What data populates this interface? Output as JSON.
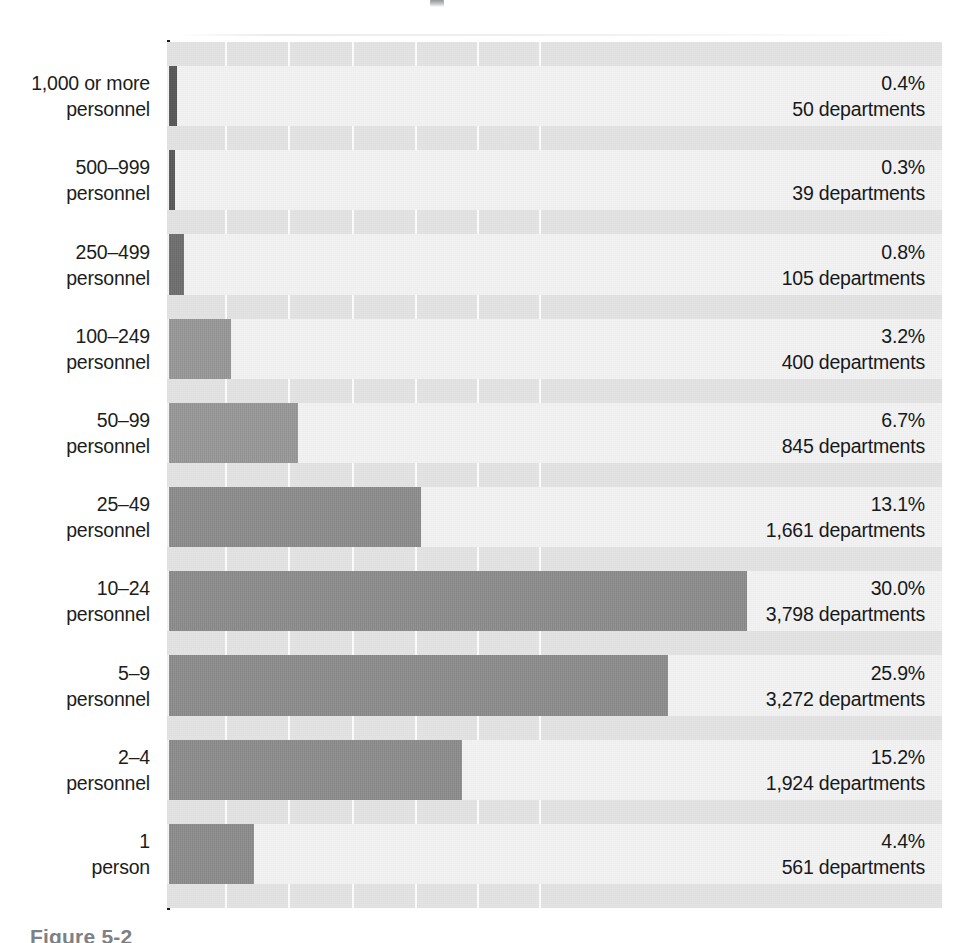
{
  "figure": {
    "caption": "Figure 5-2",
    "caption_clipped": true
  },
  "chart_data": {
    "type": "bar",
    "orientation": "horizontal",
    "title": "",
    "subtitle": "",
    "xlabel": "",
    "ylabel": "",
    "value_unit": "percent",
    "grid": true,
    "grid_axis": "x",
    "legend": "none",
    "xlim": [
      0,
      40
    ],
    "categories": [
      "1,000 or more personnel",
      "500–999 personnel",
      "250–499 personnel",
      "100–249 personnel",
      "50–99 personnel",
      "25–49 personnel",
      "10–24 personnel",
      "5–9 personnel",
      "2–4 personnel",
      "1 person"
    ],
    "values": [
      0.4,
      0.3,
      0.8,
      3.2,
      6.7,
      13.1,
      30.0,
      25.9,
      15.2,
      4.4
    ],
    "counts": [
      50,
      39,
      105,
      400,
      845,
      1661,
      3798,
      3272,
      1924,
      561
    ],
    "rows": [
      {
        "cat_line1": "1,000 or more",
        "cat_line2": "personnel",
        "pct_label": "0.4%",
        "count_label": "50 departments",
        "value": 0.4,
        "count": 50,
        "bar_shade": "dark"
      },
      {
        "cat_line1": "500–999",
        "cat_line2": "personnel",
        "pct_label": "0.3%",
        "count_label": "39 departments",
        "value": 0.3,
        "count": 39,
        "bar_shade": "dark"
      },
      {
        "cat_line1": "250–499",
        "cat_line2": "personnel",
        "pct_label": "0.8%",
        "count_label": "105 departments",
        "value": 0.8,
        "count": 105,
        "bar_shade": "mid"
      },
      {
        "cat_line1": "100–249",
        "cat_line2": "personnel",
        "pct_label": "3.2%",
        "count_label": "400 departments",
        "value": 3.2,
        "count": 400,
        "bar_shade": "light"
      },
      {
        "cat_line1": "50–99",
        "cat_line2": "personnel",
        "pct_label": "6.7%",
        "count_label": "845 departments",
        "value": 6.7,
        "count": 845,
        "bar_shade": "light"
      },
      {
        "cat_line1": "25–49",
        "cat_line2": "personnel",
        "pct_label": "13.1%",
        "count_label": "1,661 departments",
        "value": 13.1,
        "count": 1661,
        "bar_shade": "normal"
      },
      {
        "cat_line1": "10–24",
        "cat_line2": "personnel",
        "pct_label": "30.0%",
        "count_label": "3,798 departments",
        "value": 30.0,
        "count": 3798,
        "bar_shade": "normal"
      },
      {
        "cat_line1": "5–9",
        "cat_line2": "personnel",
        "pct_label": "25.9%",
        "count_label": "3,272 departments",
        "value": 25.9,
        "count": 3272,
        "bar_shade": "normal"
      },
      {
        "cat_line1": "2–4",
        "cat_line2": "personnel",
        "pct_label": "15.2%",
        "count_label": "1,924 departments",
        "value": 15.2,
        "count": 1924,
        "bar_shade": "normal"
      },
      {
        "cat_line1": "1",
        "cat_line2": "person",
        "pct_label": "4.4%",
        "count_label": "561 departments",
        "value": 4.4,
        "count": 561,
        "bar_shade": "normal"
      }
    ],
    "gridline_values": [
      3.0,
      6.3,
      9.6,
      12.9,
      16.1,
      19.3
    ],
    "colors": {
      "bar_fill": "#8e8e8e",
      "bar_fill_dark": "#585858",
      "bar_fill_mid": "#6f6f6f",
      "bar_fill_light": "#9a9a9a",
      "plot_background": "#e4e4e4",
      "row_band": "#f3f3f3",
      "gridline": "#ffffff",
      "axis_line": "#15181c",
      "label_text": "#1b1d20",
      "caption_text": "#7d8084"
    }
  }
}
